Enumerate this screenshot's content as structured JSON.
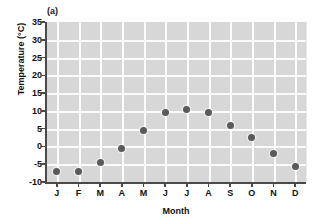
{
  "chart_data": {
    "type": "scatter",
    "title": "",
    "panel_label": "(a)",
    "xlabel": "Month",
    "ylabel": "Temperature (°C)",
    "categories": [
      "J",
      "F",
      "M",
      "A",
      "M",
      "J",
      "J",
      "A",
      "S",
      "O",
      "N",
      "D"
    ],
    "values": [
      -7,
      -7,
      -4.5,
      -0.5,
      4.5,
      9.5,
      10.5,
      9.5,
      6,
      2.5,
      -2,
      -5.5
    ],
    "ylim": [
      -10,
      35
    ],
    "ytick_labels": [
      "35",
      "30",
      "25",
      "20",
      "15",
      "10",
      "5",
      "0",
      "-5",
      "-10"
    ],
    "ytick_values": [
      35,
      30,
      25,
      20,
      15,
      10,
      5,
      0,
      -5,
      -10
    ],
    "grid": true,
    "legend": "none",
    "marker_color": "#5a5a5a",
    "plot_background": "#d7d7d7",
    "gridline_color": "#fbfbfb",
    "axis_color": "#4a4a4a"
  }
}
